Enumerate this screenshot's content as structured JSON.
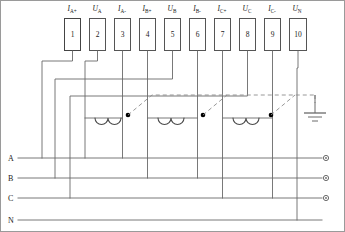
{
  "diagram": {
    "terminal_block": {
      "label": "terminal-block",
      "count": 10,
      "terminals": [
        {
          "number": "1",
          "signal": "I",
          "sub": "A+"
        },
        {
          "number": "2",
          "signal": "U",
          "sub": "A"
        },
        {
          "number": "3",
          "signal": "I",
          "sub": "A-"
        },
        {
          "number": "4",
          "signal": "I",
          "sub": "B+"
        },
        {
          "number": "5",
          "signal": "U",
          "sub": "B"
        },
        {
          "number": "6",
          "signal": "I",
          "sub": "B-"
        },
        {
          "number": "7",
          "signal": "I",
          "sub": "C+"
        },
        {
          "number": "8",
          "signal": "U",
          "sub": "C"
        },
        {
          "number": "9",
          "signal": "I",
          "sub": "C-"
        },
        {
          "number": "10",
          "signal": "U",
          "sub": "N"
        }
      ]
    },
    "phase_lines": [
      {
        "id": "A",
        "label": "A",
        "has_terminal_dot": true
      },
      {
        "id": "B",
        "label": "B",
        "has_terminal_dot": true
      },
      {
        "id": "C",
        "label": "C",
        "has_terminal_dot": true
      },
      {
        "id": "N",
        "label": "N",
        "has_terminal_dot": false
      }
    ],
    "current_transformers": [
      {
        "id": "ct-a",
        "phase": "A",
        "polarity_dot": true,
        "turns": 2
      },
      {
        "id": "ct-b",
        "phase": "B",
        "polarity_dot": true,
        "turns": 2
      },
      {
        "id": "ct-c",
        "phase": "C",
        "polarity_dot": true,
        "turns": 2
      }
    ],
    "ground": {
      "label": "earth-ground",
      "bars": 3
    },
    "colors": {
      "wire": "#6a6a6a",
      "wire_dark": "#4a4a4a",
      "dashed": "#8c8c8c",
      "box_border": "#555555",
      "text": "#1a1a1a",
      "frame": "#9a9a9a",
      "dot": "#000000"
    }
  }
}
